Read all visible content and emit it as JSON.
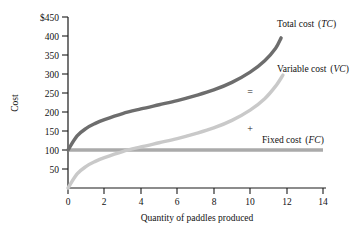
{
  "chart_data": {
    "type": "line",
    "title": "",
    "xlabel": "Quantity of paddles produced",
    "ylabel": "Cost",
    "xlim": [
      0,
      14
    ],
    "ylim": [
      0,
      450
    ],
    "grid": false,
    "legend_position": "inline-right",
    "xticks": [
      "0",
      "2",
      "4",
      "6",
      "8",
      "10",
      "12",
      "14"
    ],
    "xtick_values": [
      0,
      2,
      4,
      6,
      8,
      10,
      12,
      14
    ],
    "yticks": [
      "$450",
      "400",
      "350",
      "300",
      "250",
      "200",
      "150",
      "100",
      "50"
    ],
    "ytick_values": [
      450,
      400,
      350,
      300,
      250,
      200,
      150,
      100,
      50
    ],
    "y_origin_label": "0",
    "series": [
      {
        "name": "Total cost (TC)",
        "name_plain": "Total cost",
        "name_abbrev": "TC",
        "color": "#6d6d6d",
        "x": [
          0,
          0.5,
          1,
          1.5,
          2,
          3,
          4,
          5,
          6,
          7,
          8,
          9,
          10,
          10.8,
          11.4,
          11.7
        ],
        "values": [
          100,
          137,
          157,
          170,
          180,
          196,
          208,
          219,
          230,
          243,
          258,
          278,
          305,
          335,
          368,
          395
        ]
      },
      {
        "name": "Variable cost (VC)",
        "name_plain": "Variable cost",
        "name_abbrev": "VC",
        "color": "#c9c9c9",
        "x": [
          0,
          0.5,
          1,
          1.5,
          2,
          3,
          4,
          5,
          6,
          7,
          8,
          9,
          10,
          10.8,
          11.4,
          11.8
        ],
        "values": [
          0,
          37,
          57,
          70,
          80,
          96,
          108,
          119,
          130,
          143,
          158,
          178,
          205,
          235,
          268,
          297
        ]
      },
      {
        "name": "Fixed cost (FC)",
        "name_plain": "Fixed cost",
        "name_abbrev": "FC",
        "color": "#aaaaaa",
        "x": [
          0,
          14
        ],
        "values": [
          100,
          100
        ]
      }
    ],
    "annotations": [
      {
        "text": "=",
        "x": 10.0,
        "y": 253,
        "meaning": "total-cost-equals"
      },
      {
        "text": "+",
        "x": 10.0,
        "y": 155,
        "meaning": "plus-fixed-cost"
      }
    ]
  }
}
